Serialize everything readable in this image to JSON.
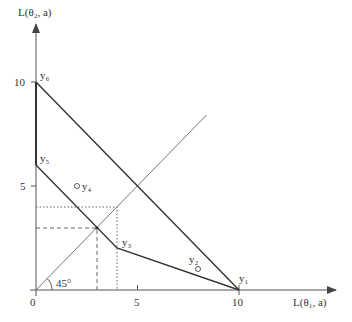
{
  "diagram": {
    "y_axis_label": "L(θ₂, a)",
    "x_axis_label": "L(θ₁, a)",
    "origin_label": "0",
    "x_ticks": [
      "5",
      "10"
    ],
    "y_ticks": [
      "5",
      "10"
    ],
    "angle_label": "45°",
    "points": {
      "y1": {
        "label": "y₁",
        "x": 10,
        "y": 0
      },
      "y2": {
        "label": "y₂",
        "x": 8,
        "y": 1
      },
      "y3": {
        "label": "y₃",
        "x": 4,
        "y": 2
      },
      "y4": {
        "label": "y₄",
        "x": 2,
        "y": 5
      },
      "y5": {
        "label": "y₅",
        "x": 0,
        "y": 6
      },
      "y6": {
        "label": "y₆",
        "x": 0,
        "y": 10
      }
    },
    "boundary_polygon": [
      [
        0,
        10
      ],
      [
        10,
        0
      ],
      [
        4,
        2
      ],
      [
        0,
        6
      ]
    ],
    "lower_boundary": [
      [
        0,
        6
      ],
      [
        3,
        3
      ],
      [
        4,
        2
      ],
      [
        10,
        0
      ]
    ],
    "upper_boundary": [
      [
        0,
        10
      ],
      [
        10,
        0
      ]
    ],
    "diagonal_45": [
      [
        0,
        0
      ],
      [
        8.4,
        8.4
      ]
    ],
    "dashed_guides": {
      "value": 3
    },
    "dotted_guides": {
      "value": 4
    },
    "colors": {
      "axis": "#555555",
      "boundary": "#333333",
      "diagonal": "#777777",
      "guides": "#666666"
    }
  }
}
